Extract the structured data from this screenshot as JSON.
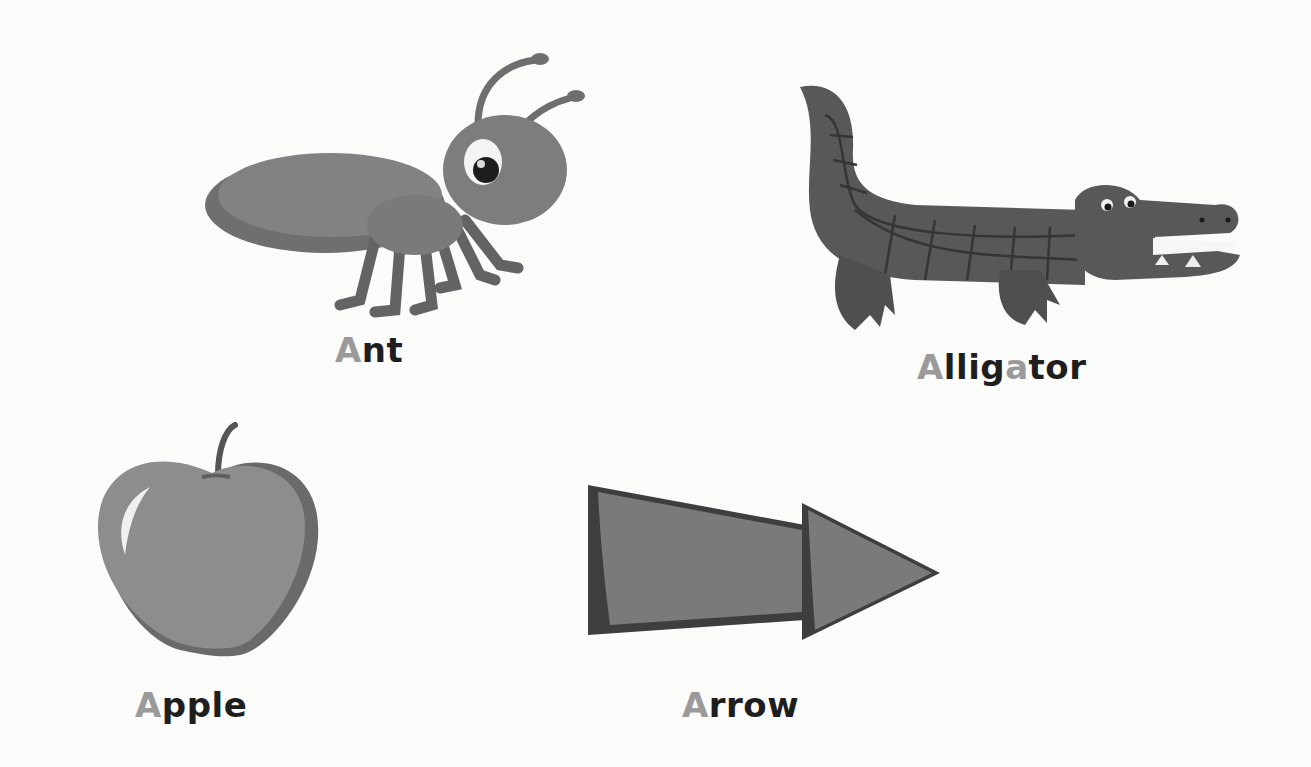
{
  "worksheet": {
    "letter": "A",
    "highlight_color": "#9a9a9a",
    "text_color": "#1e1e1e",
    "items": [
      {
        "word": "Ant",
        "parts": [
          "A",
          "nt",
          "",
          ""
        ],
        "picture": "ant-illustration"
      },
      {
        "word": "Alligator",
        "parts": [
          "A",
          "llig",
          "a",
          "tor"
        ],
        "picture": "alligator-illustration"
      },
      {
        "word": "Apple",
        "parts": [
          "A",
          "pple",
          "",
          ""
        ],
        "picture": "apple-illustration"
      },
      {
        "word": "Arrow",
        "parts": [
          "A",
          "rrow",
          "",
          ""
        ],
        "picture": "arrow-illustration"
      }
    ]
  }
}
